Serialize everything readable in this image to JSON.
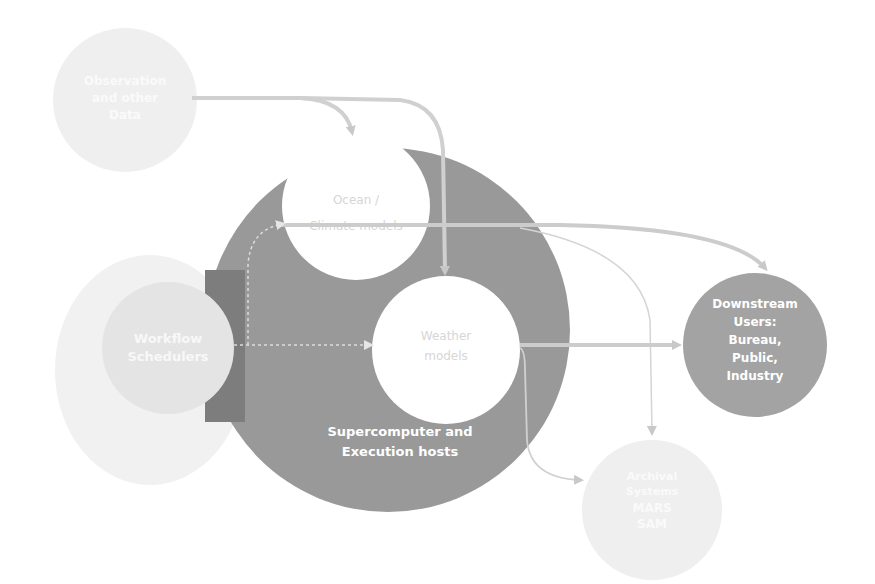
{
  "diagram": {
    "nodes": {
      "observation": {
        "line1": "Observation",
        "line2": "and other",
        "line3": "Data"
      },
      "ocean": {
        "line1": "Ocean /",
        "line2": "Climate models"
      },
      "weather": {
        "line1": "Weather",
        "line2": "models"
      },
      "supercomputer": {
        "line1": "Supercomputer and",
        "line2": "Execution hosts"
      },
      "workflow": {
        "line1": "Workflow",
        "line2": "Schedulers"
      },
      "downstream": {
        "line1": "Downstream",
        "line2": "Users:",
        "line3": "Bureau,",
        "line4": "Public,",
        "line5": "Industry"
      },
      "archival": {
        "line1": "Archival",
        "line2": "Systems",
        "line3": "MARS",
        "line4": "SAM"
      }
    },
    "colors": {
      "big_circle": "#999999",
      "dark_rect": "#7d7d7d",
      "white_node": "#ffffff",
      "downstream": "#a3a3a3",
      "faint_node": "#ececec",
      "arrow": "#cfcfcf",
      "node_text_light": "#d8d8d8",
      "node_text_white": "#ffffff"
    }
  }
}
